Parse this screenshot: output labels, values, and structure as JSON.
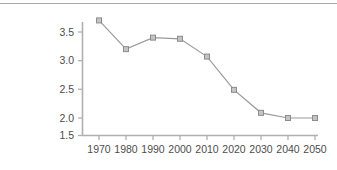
{
  "chart_data": {
    "type": "line",
    "title": "",
    "subtitle": "",
    "xlabel": "",
    "ylabel": "",
    "categories": [
      "1970",
      "1980",
      "1990",
      "2000",
      "2010",
      "2020",
      "2030",
      "2040",
      "2050"
    ],
    "x": [
      1970,
      1980,
      1990,
      2000,
      2010,
      2020,
      2030,
      2040,
      2050
    ],
    "values": [
      3.7,
      3.2,
      3.4,
      3.38,
      3.07,
      2.49,
      2.09,
      2.0,
      2.0
    ],
    "series": [
      {
        "name": "",
        "values": [
          3.7,
          3.2,
          3.4,
          3.38,
          3.07,
          2.49,
          2.09,
          2.0,
          2.0
        ]
      }
    ],
    "ylim": [
      1.5,
      3.9
    ],
    "xlim": [
      1965,
      2055
    ],
    "yticks": [
      1.5,
      2.0,
      2.5,
      3.0,
      3.5
    ],
    "ytick_labels": [
      "1.5",
      "2.0",
      "2.5",
      "3.0",
      "3.5"
    ],
    "xticks": [
      1970,
      1980,
      1990,
      2000,
      2010,
      2020,
      2030,
      2040,
      2050
    ],
    "xtick_labels": [
      "1970",
      "1980",
      "1990",
      "2000",
      "2010",
      "2020",
      "2030",
      "2040",
      "2050"
    ],
    "grid": false,
    "legend": false,
    "legend_position": "none",
    "marker": "square",
    "annotations": []
  },
  "style": {
    "line_color": "#9a9a9a",
    "marker_fill": "#c4c4c4",
    "marker_edge": "#8c8c8c",
    "axis_color": "#b0b0b0",
    "tick_label_color": "#4d4d4d",
    "top_rule_color": "#a8a8a8",
    "background": "#ffffff"
  }
}
